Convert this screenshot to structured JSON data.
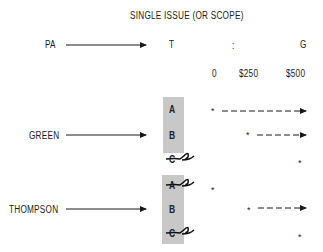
{
  "title": "SINGLE ISSUE (OR SCOPE)",
  "header_row": {
    "left_label": "PA",
    "middle_label": "T",
    "separator": ":",
    "right_label": "G"
  },
  "scale": {
    "ticks": [
      "0",
      "$250",
      "$500"
    ]
  },
  "groups": [
    {
      "label": "GREEN",
      "options": [
        {
          "letter": "A",
          "struck": false,
          "marker_at": "0",
          "extends_to": "$500"
        },
        {
          "letter": "B",
          "struck": false,
          "marker_at": "$250",
          "extends_to": "$500"
        },
        {
          "letter": "C",
          "struck": true,
          "marker_at": "$500",
          "extends_to": null
        }
      ]
    },
    {
      "label": "THOMPSON",
      "options": [
        {
          "letter": "A",
          "struck": true,
          "marker_at": "0",
          "extends_to": null
        },
        {
          "letter": "B",
          "struck": false,
          "marker_at": "$250",
          "extends_to": "$500"
        },
        {
          "letter": "C",
          "struck": true,
          "marker_at": "$500",
          "extends_to": null
        }
      ]
    }
  ],
  "marker_glyph": "*",
  "colors": {
    "box": "#c8c8c8",
    "ink": "#1a1a1a"
  }
}
